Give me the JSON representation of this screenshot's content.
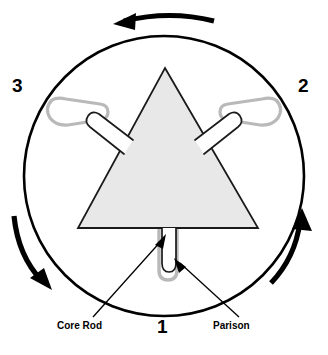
{
  "diagram": {
    "stations": [
      {
        "id": "1",
        "label": "1",
        "position": "bottom-center"
      },
      {
        "id": "2",
        "label": "2",
        "position": "right"
      },
      {
        "id": "3",
        "label": "3",
        "position": "left"
      }
    ],
    "callouts": [
      {
        "id": "core-rod",
        "label": "Core Rod",
        "position": "bottom-left"
      },
      {
        "id": "parison",
        "label": "Parison",
        "position": "bottom-right"
      }
    ],
    "rotation": {
      "direction": "counter-clockwise",
      "arrows": [
        {
          "name": "rotation-arrow-top",
          "points": "left"
        },
        {
          "name": "rotation-arrow-left",
          "points": "down"
        },
        {
          "name": "rotation-arrow-right",
          "points": "up"
        }
      ]
    },
    "shapes": {
      "outer_circle": {
        "name": "rotary-circle",
        "cx": 164,
        "cy": 176,
        "r": 140
      },
      "triangle": {
        "name": "mold-triangle",
        "apex_x": 165,
        "apex_y": 68,
        "base_left_x": 78,
        "base_right_x": 258,
        "base_y": 228
      },
      "core_rods": [
        {
          "name": "core-rod-station-1",
          "orientation": "down"
        },
        {
          "name": "core-rod-station-2",
          "orientation": "upper-right"
        },
        {
          "name": "core-rod-station-3",
          "orientation": "upper-left"
        }
      ],
      "parisons": [
        {
          "name": "parison-station-1",
          "orientation": "down"
        },
        {
          "name": "parison-station-2",
          "orientation": "upper-right"
        },
        {
          "name": "parison-station-3",
          "orientation": "upper-left"
        }
      ]
    },
    "colors": {
      "stroke": "#000000",
      "triangle_fill": "#e8e8e8",
      "parison_gray": "#b9b9b9",
      "background": "#ffffff"
    }
  }
}
